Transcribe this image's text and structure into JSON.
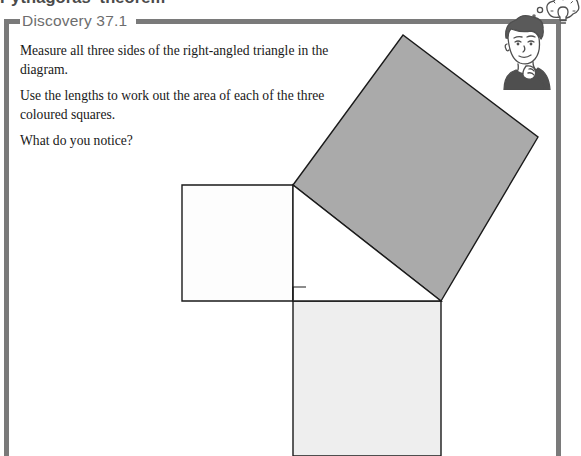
{
  "page": {
    "chapter_title": "Pythagoras' theorem",
    "width": 581,
    "height": 456,
    "background": "#ffffff",
    "frame_color": "#7a7a7a"
  },
  "header": {
    "label": "Discovery 37.1",
    "label_color": "#6d6d6d",
    "rule_color": "#7a7a7a"
  },
  "instructions": [
    "Measure all three sides of the right-angled triangle in the diagram.",
    "Use the lengths to work out the area of each of the three coloured squares.",
    "What do you notice?"
  ],
  "illustration": {
    "name": "thinking-student-with-lightbulb",
    "description": "Cartoon of a student resting chin on hand with a lightbulb thought bubble",
    "ink_color": "#4f4f4f"
  },
  "diagram": {
    "type": "pythagoras-three-squares",
    "stroke_color": "#1a1a1a",
    "stroke_width": 1.4,
    "right_angle_marker": {
      "name": "right-angle-marker",
      "x": 293,
      "y": 287,
      "size": 13
    },
    "triangle": {
      "name": "right-angled-triangle",
      "vertices": [
        [
          293,
          185
        ],
        [
          293,
          301
        ],
        [
          441,
          301
        ]
      ],
      "fill": "#ffffff",
      "legs": {
        "vertical": 116,
        "horizontal": 148
      },
      "hypotenuse": 188
    },
    "squares": [
      {
        "name": "square-on-vertical-leg",
        "label": "left square",
        "fill": "#fdfdfd",
        "points": [
          [
            182,
            185
          ],
          [
            293,
            185
          ],
          [
            293,
            301
          ],
          [
            182,
            301
          ]
        ],
        "side": 116
      },
      {
        "name": "square-on-horizontal-leg",
        "label": "bottom square",
        "fill": "#eeeeee",
        "points": [
          [
            293,
            301
          ],
          [
            441,
            301
          ],
          [
            441,
            456
          ],
          [
            293,
            456
          ]
        ],
        "side": 148
      },
      {
        "name": "square-on-hypotenuse",
        "label": "tilted shaded square",
        "fill": "#aaaaaa",
        "points": [
          [
            293,
            185
          ],
          [
            403,
            35
          ],
          [
            538,
            137
          ],
          [
            441,
            301
          ]
        ],
        "side": 188
      }
    ]
  }
}
